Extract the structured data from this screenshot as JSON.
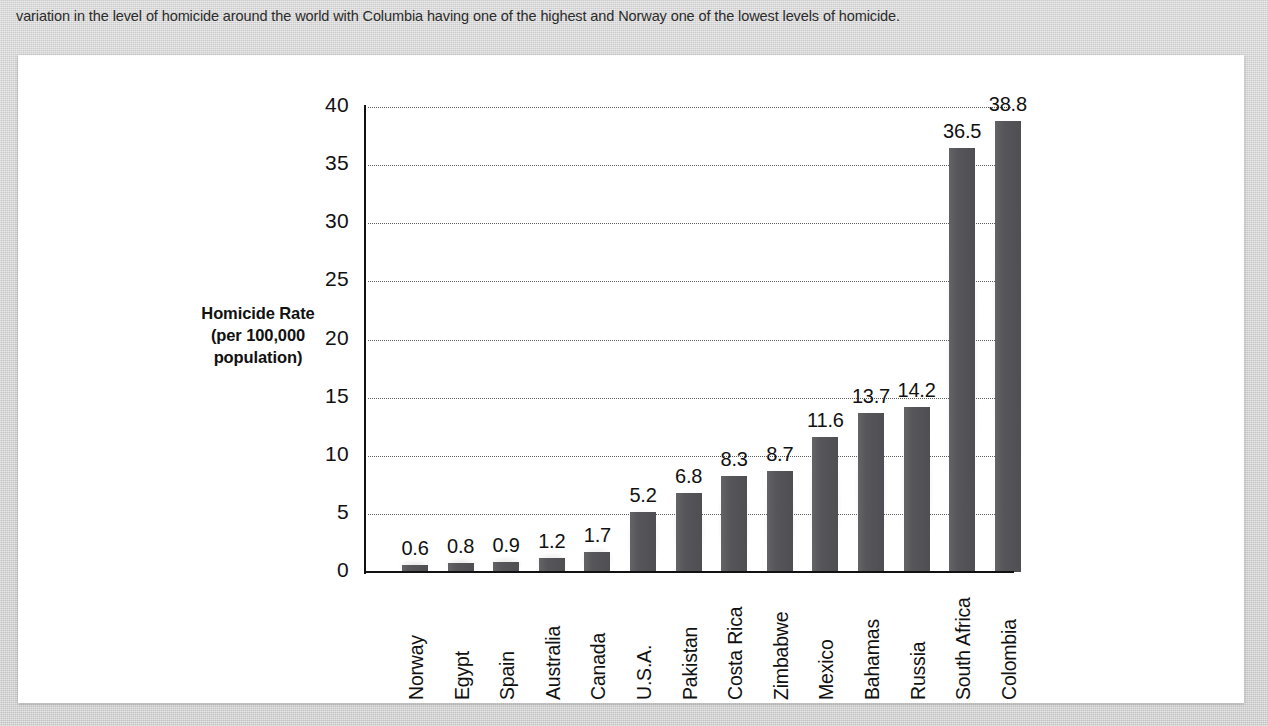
{
  "caption": {
    "text": "variation in the level of homicide around the world with Columbia having one of the highest and Norway one of the lowest levels of homicide."
  },
  "figure": {
    "background_color": "#ffffff",
    "page_background_color": "#d6d6d6"
  },
  "chart_data": {
    "type": "bar",
    "title": "",
    "xlabel": "",
    "ylabel": "Homicide Rate (per 100,000 population)",
    "ylabel_lines": [
      "Homicide Rate",
      "(per 100,000",
      "population)"
    ],
    "categories": [
      "Norway",
      "Egypt",
      "Spain",
      "Australia",
      "Canada",
      "U.S.A.",
      "Pakistan",
      "Costa Rica",
      "Zimbabwe",
      "Mexico",
      "Bahamas",
      "Russia",
      "South Africa",
      "Colombia"
    ],
    "values": [
      0.6,
      0.8,
      0.9,
      1.2,
      1.7,
      5.2,
      6.8,
      8.3,
      8.7,
      11.6,
      13.7,
      14.2,
      36.5,
      38.8
    ],
    "value_labels": [
      "0.6",
      "0.8",
      "0.9",
      "1.2",
      "1.7",
      "5.2",
      "6.8",
      "8.3",
      "8.7",
      "11.6",
      "13.7",
      "14.2",
      "36.5",
      "38.8"
    ],
    "ylim": [
      0,
      40
    ],
    "yticks": [
      0,
      5,
      10,
      15,
      20,
      25,
      30,
      35,
      40
    ],
    "ytick_labels": [
      "0",
      "5",
      "10",
      "15",
      "20",
      "25",
      "30",
      "35",
      "40"
    ],
    "grid": true,
    "grid_style": "dotted",
    "legend": null,
    "bar_color": "#55555a",
    "axis_color": "#111111",
    "gridline_color": "#5c5c5c"
  }
}
